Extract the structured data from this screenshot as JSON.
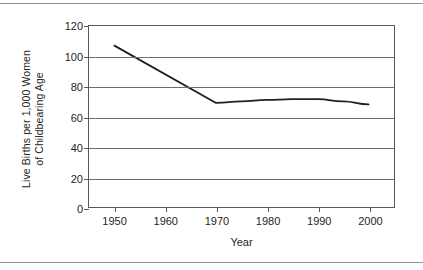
{
  "figure": {
    "axis_color": "#58595b",
    "grid_color": "#6d6e71",
    "line_color": "#231f20",
    "background": "#ffffff",
    "rule_color": "#8e9094"
  },
  "chart_data": {
    "type": "line",
    "title": "",
    "xlabel": "Year",
    "ylabel_line1": "Live Births per 1,000 Women",
    "ylabel_line2": "of Childbearing Age",
    "x": [
      1950,
      1970,
      1975,
      1980,
      1985,
      1990,
      1995,
      2000
    ],
    "values": [
      107,
      69,
      70,
      71,
      71.5,
      71.5,
      70,
      68
    ],
    "series": [
      {
        "name": "Live births per 1,000 women of childbearing age",
        "values": [
          107,
          69,
          70,
          71,
          71.5,
          71.5,
          70,
          68
        ]
      }
    ],
    "xlim": [
      1945,
      2005
    ],
    "ylim": [
      0,
      120
    ],
    "xticks": [
      1950,
      1960,
      1970,
      1980,
      1990,
      2000
    ],
    "xticklabels": [
      "1950",
      "1960",
      "1970",
      "1980",
      "1990",
      "2000"
    ],
    "yticks": [
      0,
      20,
      40,
      60,
      80,
      100,
      120
    ],
    "yticklabels": [
      "0",
      "20",
      "40",
      "60",
      "80",
      "100",
      "120"
    ],
    "grid": "horizontal",
    "legend": "none"
  }
}
